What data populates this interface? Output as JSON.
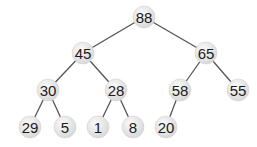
{
  "diagram": {
    "type": "binary-heap-tree",
    "colors": {
      "background": "#ffffff",
      "edge": "#555555",
      "node_fill_light": "#f7f7f7",
      "node_fill_dark": "#d9d9d9",
      "label": "#1a1a1a"
    },
    "node_radius": 11,
    "nodes": [
      {
        "id": "n0",
        "label": "88",
        "x": 144,
        "y": 17
      },
      {
        "id": "n1",
        "label": "45",
        "x": 83,
        "y": 53
      },
      {
        "id": "n2",
        "label": "65",
        "x": 206,
        "y": 53
      },
      {
        "id": "n3",
        "label": "30",
        "x": 48,
        "y": 90
      },
      {
        "id": "n4",
        "label": "28",
        "x": 116,
        "y": 90
      },
      {
        "id": "n5",
        "label": "58",
        "x": 180,
        "y": 90
      },
      {
        "id": "n6",
        "label": "55",
        "x": 238,
        "y": 90
      },
      {
        "id": "n7",
        "label": "29",
        "x": 30,
        "y": 127
      },
      {
        "id": "n8",
        "label": "5",
        "x": 65,
        "y": 127
      },
      {
        "id": "n9",
        "label": "1",
        "x": 98,
        "y": 127
      },
      {
        "id": "n10",
        "label": "8",
        "x": 133,
        "y": 127
      },
      {
        "id": "n11",
        "label": "20",
        "x": 166,
        "y": 127
      }
    ],
    "edges": [
      [
        "n0",
        "n1"
      ],
      [
        "n0",
        "n2"
      ],
      [
        "n1",
        "n3"
      ],
      [
        "n1",
        "n4"
      ],
      [
        "n2",
        "n5"
      ],
      [
        "n2",
        "n6"
      ],
      [
        "n3",
        "n7"
      ],
      [
        "n3",
        "n8"
      ],
      [
        "n4",
        "n9"
      ],
      [
        "n4",
        "n10"
      ],
      [
        "n5",
        "n11"
      ]
    ]
  }
}
